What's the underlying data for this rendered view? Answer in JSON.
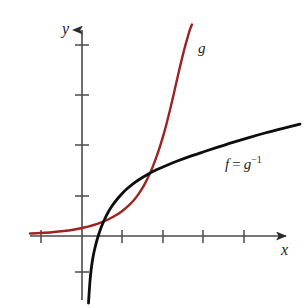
{
  "figure": {
    "width": 304,
    "height": 308,
    "background": "#ffffff"
  },
  "labels": {
    "y_axis": "y",
    "x_axis": "x",
    "curve_g": "g",
    "curve_f_base": "f",
    "curve_f_equals": "=",
    "curve_f_inverse_base": "g",
    "curve_f_inverse_exponent": "−1"
  },
  "colors": {
    "exponential_curve": "#9b2321",
    "logarithm_curve": "#0d0d0d",
    "axis": "#4a4a4a",
    "label_text": "#1f1f1f",
    "background": "#ffffff"
  },
  "chart_data": {
    "type": "line",
    "title": "",
    "subtitle": "",
    "xlabel": "x",
    "ylabel": "y",
    "grid": false,
    "legend_position": "inline-annotation",
    "axis_style": "arrowed-cartesian",
    "origin_px": {
      "x": 82,
      "y": 236
    },
    "unit_px": {
      "x": 40.5,
      "y": 25
    },
    "xlim": [
      -1.3,
      5.2
    ],
    "ylim": [
      -2.6,
      8.6
    ],
    "x_ticks": [
      -1,
      1,
      2,
      3,
      4
    ],
    "y_ticks": [
      -2,
      1.6,
      3.6,
      5.6,
      7.6
    ],
    "annotations": [
      {
        "text": "g",
        "x_px": 198,
        "y_px": 40,
        "color": "#1f1f1f"
      },
      {
        "text": "f = g−1",
        "x_px": 225,
        "y_px": 154,
        "color": "#1f1f1f"
      }
    ],
    "series": [
      {
        "name": "g",
        "label": "g",
        "role": "exponential",
        "color": "#9b2321",
        "width": 2.4,
        "points_px": [
          [
            30,
            233.5
          ],
          [
            40,
            233.0
          ],
          [
            52,
            232.2
          ],
          [
            64,
            231.0
          ],
          [
            76,
            229.2
          ],
          [
            88,
            226.6
          ],
          [
            98,
            223.6
          ],
          [
            107,
            220.0
          ],
          [
            115,
            215.8
          ],
          [
            122,
            211.2
          ],
          [
            128,
            206.2
          ],
          [
            134,
            200.0
          ],
          [
            139,
            193.4
          ],
          [
            144,
            185.4
          ],
          [
            148,
            177.6
          ],
          [
            152,
            168.6
          ],
          [
            156,
            158.2
          ],
          [
            160,
            146.4
          ],
          [
            164,
            133.2
          ],
          [
            167,
            122.0
          ],
          [
            170,
            110.0
          ],
          [
            173,
            97.2
          ],
          [
            176,
            84.0
          ],
          [
            179,
            71.0
          ],
          [
            182,
            58.4
          ],
          [
            185,
            46.6
          ],
          [
            188,
            36.0
          ],
          [
            190,
            29.4
          ],
          [
            192,
            24.5
          ]
        ]
      },
      {
        "name": "f",
        "label": "f = g⁻¹",
        "role": "logarithm",
        "color": "#0d0d0d",
        "width": 2.8,
        "points_px": [
          [
            88.5,
            303
          ],
          [
            89.2,
            292
          ],
          [
            90.0,
            281
          ],
          [
            91.0,
            271
          ],
          [
            92.2,
            262
          ],
          [
            93.6,
            254
          ],
          [
            95.2,
            247
          ],
          [
            97.0,
            240
          ],
          [
            99.0,
            233.5
          ],
          [
            101.5,
            226.5
          ],
          [
            104.5,
            219.5
          ],
          [
            108.0,
            212.5
          ],
          [
            112.0,
            206.0
          ],
          [
            116.5,
            200.0
          ],
          [
            121.5,
            194.2
          ],
          [
            127.0,
            188.8
          ],
          [
            133.0,
            183.8
          ],
          [
            140.0,
            179.0
          ],
          [
            148.0,
            174.2
          ],
          [
            157.0,
            169.6
          ],
          [
            167.0,
            165.2
          ],
          [
            178.0,
            160.8
          ],
          [
            190.0,
            156.4
          ],
          [
            203.0,
            152.0
          ],
          [
            217.0,
            147.4
          ],
          [
            232.0,
            142.6
          ],
          [
            248.0,
            137.8
          ],
          [
            265.0,
            133.0
          ],
          [
            282.0,
            128.6
          ],
          [
            300.0,
            124.2
          ]
        ]
      }
    ]
  }
}
